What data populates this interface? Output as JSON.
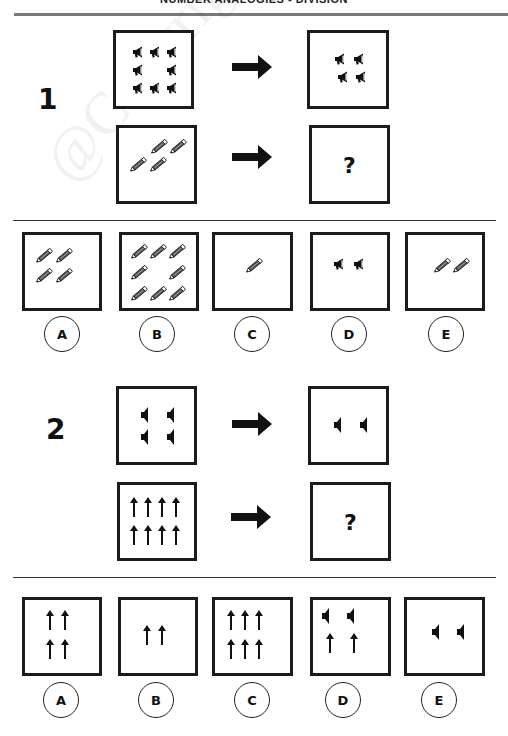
{
  "header": {
    "title": "NUMBER ANALOGIES - DIVISION"
  },
  "watermark": "@Copyright SmartKidzzz.Online",
  "colors": {
    "ink": "#1b1b1b",
    "rule": "#7a7a7a",
    "background": "#ffffff"
  },
  "questions": [
    {
      "number": "1",
      "premise": {
        "from": {
          "icon": "megaphone-icon",
          "count": 8
        },
        "to": {
          "icon": "megaphone-icon",
          "count": 4
        }
      },
      "query": {
        "from": {
          "icon": "pencil-icon",
          "count": 4
        },
        "to": {
          "unknown": "?"
        }
      },
      "options": [
        {
          "label": "A",
          "icon": "pencil-icon",
          "count": 4
        },
        {
          "label": "B",
          "icon": "pencil-icon",
          "count": 8
        },
        {
          "label": "C",
          "icon": "pencil-icon",
          "count": 1
        },
        {
          "label": "D",
          "icon": "megaphone-icon",
          "count": 2
        },
        {
          "label": "E",
          "icon": "pencil-icon",
          "count": 2
        }
      ]
    },
    {
      "number": "2",
      "premise": {
        "from": {
          "icon": "speaker-icon",
          "count": 4
        },
        "to": {
          "icon": "speaker-icon",
          "count": 2
        }
      },
      "query": {
        "from": {
          "icon": "up-arrow-icon",
          "count": 8
        },
        "to": {
          "unknown": "?"
        }
      },
      "options": [
        {
          "label": "A",
          "icon": "up-arrow-icon",
          "count": 4
        },
        {
          "label": "B",
          "icon": "up-arrow-icon",
          "count": 2
        },
        {
          "label": "C",
          "icon": "up-arrow-icon",
          "count": 6
        },
        {
          "label": "D",
          "icon": "speaker-icon+up-arrow-icon",
          "count": 4
        },
        {
          "label": "E",
          "icon": "speaker-icon",
          "count": 2
        }
      ]
    }
  ]
}
